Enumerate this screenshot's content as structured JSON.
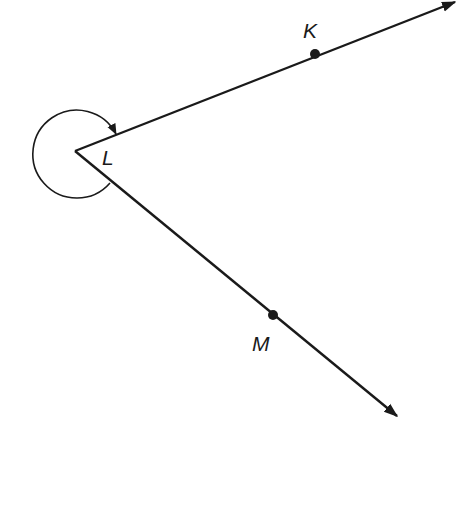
{
  "diagram": {
    "type": "geometry-angle",
    "colors": {
      "stroke": "#1a1a1a",
      "background": "#ffffff"
    },
    "vertex": {
      "label": "L",
      "x": 75,
      "y": 151
    },
    "points": [
      {
        "id": "K",
        "label": "K",
        "x": 315,
        "y": 54
      },
      {
        "id": "M",
        "label": "M",
        "x": 273,
        "y": 315
      }
    ],
    "rays": [
      {
        "from": "L",
        "through": "K",
        "end": [
          460,
          0
        ]
      },
      {
        "from": "L",
        "through": "M",
        "end": [
          401,
          420
        ]
      }
    ],
    "angle_marker": {
      "kind": "reflex",
      "direction": "counterclockwise",
      "arrow": true
    }
  }
}
